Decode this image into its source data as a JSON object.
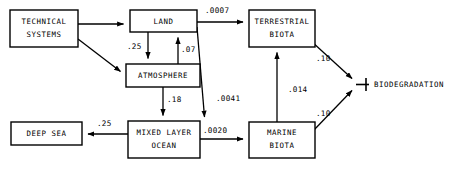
{
  "diagram": {
    "nodes": [
      {
        "id": "technical_systems",
        "label_line1": "TECHNICAL",
        "label_line2": "SYSTEMS"
      },
      {
        "id": "land",
        "label_line1": "LAND",
        "label_line2": ""
      },
      {
        "id": "atmosphere",
        "label_line1": "ATMOSPHERE",
        "label_line2": ""
      },
      {
        "id": "terrestrial_biota",
        "label_line1": "TERRESTRIAL",
        "label_line2": "BIOTA"
      },
      {
        "id": "mixed_layer_ocean",
        "label_line1": "MIXED LAYER",
        "label_line2": "OCEAN"
      },
      {
        "id": "marine_biota",
        "label_line1": "MARINE",
        "label_line2": "BIOTA"
      },
      {
        "id": "deep_sea",
        "label_line1": "DEEP SEA",
        "label_line2": ""
      }
    ],
    "sink": {
      "id": "biodegradation",
      "label": "BIODEGRADATION"
    },
    "fluxes": [
      {
        "id": "land-to-atmosphere",
        "value": ".25"
      },
      {
        "id": "atmosphere-to-land",
        "value": ".07"
      },
      {
        "id": "land-to-terrestrial-biota",
        "value": ".0007"
      },
      {
        "id": "land-to-mixed-layer-ocean",
        "value": ".0041"
      },
      {
        "id": "atmosphere-to-mixed-layer-ocean",
        "value": ".18"
      },
      {
        "id": "mixed-layer-ocean-to-deep-sea",
        "value": ".25"
      },
      {
        "id": "mixed-layer-ocean-to-marine-biota",
        "value": ".0020"
      },
      {
        "id": "marine-biota-to-terrestrial-biota",
        "value": ".014"
      },
      {
        "id": "terrestrial-biota-to-biodegradation",
        "value": ".10"
      },
      {
        "id": "marine-biota-to-biodegradation",
        "value": ".10"
      }
    ],
    "colors": {
      "stroke": "#000000",
      "fill": "#ffffff",
      "text": "#000000"
    }
  }
}
